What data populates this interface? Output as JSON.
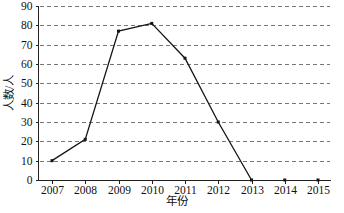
{
  "chart_data": {
    "type": "line",
    "title": "",
    "xlabel": "年份",
    "ylabel": "人数/人",
    "categories": [
      "2007",
      "2008",
      "2009",
      "2010",
      "2011",
      "2012",
      "2013",
      "2014",
      "2015"
    ],
    "x": [
      2007,
      2008,
      2009,
      2010,
      2011,
      2012,
      2013,
      2014,
      2015
    ],
    "values": [
      10,
      21,
      77,
      81,
      63,
      30,
      0,
      0,
      0
    ],
    "series": [
      {
        "name": "人数",
        "values": [
          10,
          21,
          77,
          81,
          63,
          30,
          0,
          0,
          0
        ]
      }
    ],
    "connected_through": 2013,
    "ylim": [
      0,
      90
    ],
    "yticks": [
      0,
      10,
      20,
      30,
      40,
      50,
      60,
      70,
      80,
      90
    ],
    "ytick_labels": [
      "0",
      "10",
      "20",
      "30",
      "40",
      "50",
      "60",
      "70",
      "80",
      "90"
    ],
    "xtick_labels": [
      "2007",
      "2008",
      "2009",
      "2010",
      "2011",
      "2012",
      "2013",
      "2014",
      "2015"
    ],
    "grid": "horizontal-dashed",
    "legend": "none",
    "marker": "square",
    "colors": {
      "line": "#141414",
      "marker": "#141414",
      "grid": "#777777",
      "axis": "#222222",
      "text": "#111111",
      "background": "#ffffff"
    }
  },
  "axes": {
    "y_title": "人数/人",
    "x_title": "年份"
  }
}
